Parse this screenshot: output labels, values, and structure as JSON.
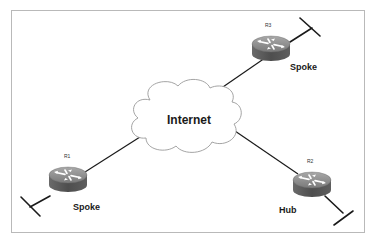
{
  "diagram": {
    "type": "hub-and-spoke network topology",
    "cloud": {
      "label": "Internet"
    },
    "routers": [
      {
        "id": "R1",
        "name": "R1",
        "role": "Spoke"
      },
      {
        "id": "R2",
        "name": "R2",
        "role": "Hub"
      },
      {
        "id": "R3",
        "name": "R3",
        "role": "Spoke"
      }
    ],
    "links": [
      {
        "from": "R1",
        "to": "Internet"
      },
      {
        "from": "R2",
        "to": "Internet"
      },
      {
        "from": "R3",
        "to": "Internet"
      }
    ],
    "colors": {
      "line": "#1a1a1a",
      "router_top": "#8c8c8c",
      "router_side": "#5a5a5a",
      "frame": "#b9b9b9"
    }
  }
}
